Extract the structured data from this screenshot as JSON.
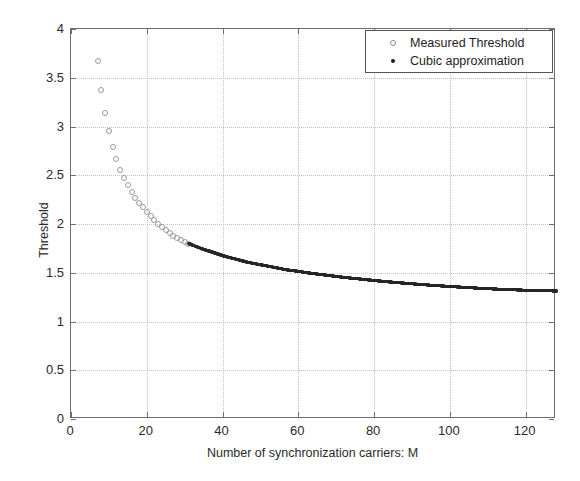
{
  "chart_data": {
    "type": "scatter",
    "title": "",
    "xlabel": "Number of synchronization carriers: M",
    "ylabel": "Threshold",
    "xlim": [
      0,
      128
    ],
    "ylim": [
      0,
      4
    ],
    "xticks": [
      0,
      20,
      40,
      60,
      80,
      100,
      120
    ],
    "yticks": [
      0,
      0.5,
      1,
      1.5,
      2,
      2.5,
      3,
      3.5,
      4
    ],
    "xtick_labels": [
      "0",
      "20",
      "40",
      "60",
      "80",
      "100",
      "120"
    ],
    "ytick_labels": [
      "0",
      "0.5",
      "1",
      "1.5",
      "2",
      "2.5",
      "3",
      "3.5",
      "4"
    ],
    "grid": true,
    "grid_style": "dotted",
    "grid_color": "#c2c2c2",
    "legend_position": "top-right",
    "series": [
      {
        "name": "Measured Threshold",
        "marker": "open-circle",
        "color": "#9a9a9a",
        "x": [
          7,
          8,
          9,
          10,
          11,
          12,
          13,
          14,
          15,
          16,
          17,
          18,
          19,
          20,
          21,
          22,
          23,
          24,
          25,
          26,
          27,
          28,
          29,
          30,
          31
        ],
        "y": [
          3.67,
          3.37,
          3.14,
          2.95,
          2.79,
          2.67,
          2.55,
          2.47,
          2.4,
          2.33,
          2.27,
          2.22,
          2.17,
          2.12,
          2.08,
          2.04,
          2.0,
          1.97,
          1.94,
          1.91,
          1.88,
          1.86,
          1.84,
          1.82,
          1.8
        ]
      },
      {
        "name": "Cubic approximation",
        "marker": "filled-dot",
        "color": "#262626",
        "x": [
          31,
          33,
          35,
          37,
          39,
          41,
          43,
          45,
          47,
          49,
          51,
          53,
          55,
          57,
          59,
          61,
          63,
          65,
          67,
          69,
          71,
          73,
          75,
          77,
          79,
          81,
          83,
          85,
          87,
          89,
          91,
          93,
          95,
          97,
          99,
          101,
          103,
          105,
          107,
          109,
          111,
          113,
          115,
          117,
          119,
          121,
          123,
          125,
          127,
          128
        ],
        "y": [
          1.8,
          1.77,
          1.74,
          1.715,
          1.69,
          1.665,
          1.645,
          1.625,
          1.605,
          1.59,
          1.575,
          1.56,
          1.545,
          1.53,
          1.52,
          1.508,
          1.497,
          1.487,
          1.477,
          1.467,
          1.458,
          1.449,
          1.441,
          1.433,
          1.425,
          1.417,
          1.41,
          1.403,
          1.396,
          1.39,
          1.384,
          1.378,
          1.372,
          1.367,
          1.362,
          1.357,
          1.352,
          1.347,
          1.343,
          1.339,
          1.335,
          1.331,
          1.328,
          1.325,
          1.322,
          1.32,
          1.318,
          1.316,
          1.314,
          1.313
        ]
      }
    ]
  },
  "legend": {
    "entries": [
      {
        "label": "Measured Threshold",
        "marker": "open-circle"
      },
      {
        "label": "Cubic approximation",
        "marker": "filled-dot"
      }
    ]
  }
}
